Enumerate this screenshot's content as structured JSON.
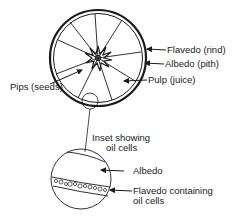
{
  "diagram": {
    "labels": {
      "flavedo": "Flavedo (rind)",
      "albedo": "Albedo (pith)",
      "pulp": "Pulp (juice)",
      "pips": "Pips (seeds)",
      "inset_line1": "Inset showing",
      "inset_line2": "oil cells",
      "inset_albedo": "Albedo",
      "inset_flavedo_line1": "Flavedo containing",
      "inset_flavedo_line2": "oil cells"
    },
    "colors": {
      "ink": "#1a1a1a",
      "background": "#ffffff"
    }
  }
}
